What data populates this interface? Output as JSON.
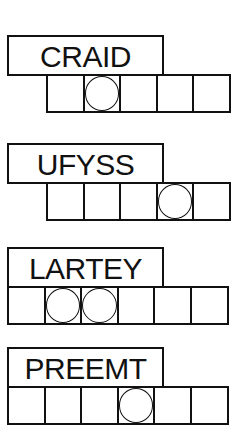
{
  "puzzles": [
    {
      "scrambled_word": "CRAIDD",
      "display_word": "CRAID",
      "cell_count": 5,
      "circled_cells": [
        2
      ]
    },
    {
      "display_word": "UFYSS",
      "cell_count": 5,
      "circled_cells": [
        4
      ]
    },
    {
      "display_word": "LARTEY",
      "cell_count": 6,
      "circled_cells": [
        2,
        3
      ]
    },
    {
      "display_word": "PREEMT",
      "cell_count": 6,
      "circled_cells": [
        4
      ]
    }
  ]
}
